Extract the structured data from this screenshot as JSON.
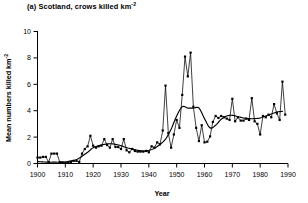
{
  "figure": {
    "panel_label": "(a)",
    "title_prefix": "(a) Scotland, crows killed km",
    "title_sup": "-2",
    "title_full": "(a) Scotland, crows killed km-2"
  },
  "chart_data": {
    "type": "line",
    "title": "(a) Scotland, crows killed km-2",
    "xlabel": "Year",
    "ylabel_prefix": "Mean numbers killed km",
    "ylabel_sup": "-2",
    "ylabel": "Mean numbers killed km-2",
    "xlim": [
      1900,
      1990
    ],
    "ylim": [
      0,
      10
    ],
    "xticks": [
      1900,
      1910,
      1920,
      1930,
      1940,
      1950,
      1960,
      1970,
      1980,
      1990
    ],
    "xtick_labels": [
      "1900",
      "1910",
      "1920",
      "1930",
      "1940",
      "1950",
      "1960",
      "1970",
      "1980",
      "1990"
    ],
    "yticks": [
      0,
      2,
      4,
      6,
      8,
      10
    ],
    "ytick_labels": [
      "0",
      "2",
      "4",
      "6",
      "8",
      "10"
    ],
    "grid": false,
    "legend": false,
    "series": [
      {
        "name": "Annual mean numbers killed",
        "marker": "filled-square",
        "color": "#000000",
        "x": [
          1900,
          1901,
          1902,
          1903,
          1904,
          1905,
          1906,
          1907,
          1908,
          1909,
          1910,
          1911,
          1912,
          1913,
          1914,
          1915,
          1916,
          1917,
          1918,
          1919,
          1920,
          1921,
          1922,
          1923,
          1924,
          1925,
          1926,
          1927,
          1928,
          1929,
          1930,
          1931,
          1932,
          1933,
          1934,
          1935,
          1936,
          1937,
          1938,
          1939,
          1940,
          1941,
          1942,
          1943,
          1944,
          1945,
          1946,
          1947,
          1948,
          1949,
          1950,
          1951,
          1952,
          1953,
          1954,
          1955,
          1956,
          1957,
          1958,
          1959,
          1960,
          1961,
          1962,
          1963,
          1964,
          1965,
          1966,
          1967,
          1968,
          1969,
          1970,
          1971,
          1972,
          1973,
          1974,
          1975,
          1976,
          1977,
          1978,
          1979,
          1980,
          1981,
          1982,
          1983,
          1984,
          1985,
          1986,
          1987,
          1988,
          1989
        ],
        "y": [
          0.45,
          0.45,
          0.5,
          0.5,
          0.1,
          0.75,
          0.75,
          0.75,
          0.1,
          0.08,
          0.05,
          0.08,
          0.12,
          0.2,
          0.2,
          0.12,
          0.75,
          1.1,
          1.3,
          2.1,
          1.35,
          1.2,
          1.3,
          1.35,
          1.85,
          1.4,
          1.2,
          1.85,
          1.25,
          1.25,
          1.1,
          1.85,
          1.0,
          0.85,
          1.1,
          0.95,
          0.9,
          0.9,
          0.9,
          0.95,
          0.85,
          1.3,
          1.2,
          1.6,
          1.45,
          2.5,
          5.9,
          2.3,
          1.2,
          2.2,
          3.3,
          2.7,
          5.2,
          8.1,
          6.6,
          8.4,
          4.3,
          2.7,
          1.7,
          2.9,
          1.6,
          1.65,
          2.05,
          3.15,
          3.6,
          3.45,
          3.6,
          3.5,
          3.4,
          3.3,
          4.9,
          3.2,
          3.5,
          3.25,
          3.25,
          3.4,
          3.3,
          4.95,
          3.2,
          3.0,
          2.2,
          3.6,
          3.5,
          3.7,
          3.5,
          4.5,
          3.8,
          3.3,
          6.2,
          3.7
        ]
      },
      {
        "name": "Smoothed trend",
        "marker": "none",
        "color": "#000000",
        "x": [
          1900,
          1902,
          1904,
          1906,
          1908,
          1910,
          1912,
          1914,
          1916,
          1918,
          1920,
          1922,
          1924,
          1926,
          1928,
          1930,
          1932,
          1934,
          1936,
          1938,
          1940,
          1942,
          1944,
          1946,
          1948,
          1950,
          1952,
          1954,
          1956,
          1958,
          1960,
          1962,
          1964,
          1966,
          1968,
          1970,
          1972,
          1974,
          1976,
          1978,
          1980,
          1982,
          1984,
          1986,
          1988
        ],
        "y": [
          0.15,
          0.12,
          0.1,
          0.1,
          0.1,
          0.12,
          0.2,
          0.3,
          0.55,
          0.85,
          1.2,
          1.35,
          1.45,
          1.5,
          1.45,
          1.35,
          1.2,
          1.1,
          1.0,
          0.95,
          1.0,
          1.15,
          1.45,
          1.85,
          2.6,
          3.6,
          4.3,
          4.2,
          4.2,
          4.2,
          3.4,
          2.7,
          2.9,
          3.35,
          3.6,
          3.65,
          3.55,
          3.45,
          3.4,
          3.4,
          3.45,
          3.6,
          3.75,
          3.9,
          3.95
        ]
      }
    ],
    "annotations": []
  },
  "axes": {
    "x_axis_label": "Year",
    "y_axis_label_prefix": "Mean numbers killed km",
    "y_axis_label_sup": "-2"
  }
}
